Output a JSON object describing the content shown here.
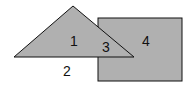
{
  "diagram": {
    "shapes": {
      "triangle": {
        "points": "73,6 14,57 134,57",
        "fill": "#b0b0b0",
        "stroke": "#111111"
      },
      "rectangle": {
        "x": 98,
        "y": 18,
        "width": 84,
        "height": 63,
        "fill": "#b0b0b0",
        "stroke": "#111111"
      }
    },
    "labels": {
      "region1": "1",
      "region2": "2",
      "region3": "3",
      "region4": "4"
    }
  }
}
